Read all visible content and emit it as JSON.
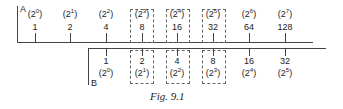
{
  "figure": {
    "caption": "Fig. 9.1",
    "scale_a": {
      "label": "A",
      "values": [
        "1",
        "2",
        "4",
        "8",
        "16",
        "32",
        "64",
        "128"
      ],
      "exponents": [
        "0",
        "1",
        "2",
        "3",
        "4",
        "5",
        "6",
        "7"
      ]
    },
    "scale_b": {
      "label": "B",
      "values": [
        "1",
        "2",
        "4",
        "8",
        "16",
        "32"
      ],
      "exponents": [
        "0",
        "1",
        "2",
        "3",
        "4",
        "5"
      ]
    },
    "highlighted_a": [
      "8",
      "16",
      "32"
    ],
    "highlighted_b": [
      "2",
      "4",
      "8"
    ]
  }
}
